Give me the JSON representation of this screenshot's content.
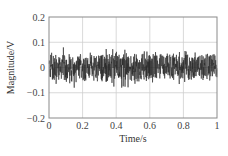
{
  "chart_data": {
    "type": "line",
    "title": "",
    "xlabel": "Time/s",
    "ylabel": "Magnitude/V",
    "xlim": [
      0,
      1
    ],
    "ylim": [
      -0.2,
      0.2
    ],
    "x_ticks": [
      0,
      0.2,
      0.4,
      0.6,
      0.8,
      1
    ],
    "x_tick_labels": [
      "0",
      "0.2",
      "0.4",
      "0.6",
      "0.8",
      "1"
    ],
    "y_ticks": [
      0.2,
      0.1,
      0,
      -0.1,
      -0.2
    ],
    "y_tick_labels": [
      "0.2",
      "0.1",
      "0",
      "−0.1",
      "−0.2"
    ],
    "grid": true,
    "legend": null,
    "series": [
      {
        "name": "noise signal",
        "description": "Dense broadband noise centered at 0 V, band roughly ±0.05 V with occasional spikes to about ±0.08 V",
        "color": "#2a2a2a",
        "mean": 0,
        "band_amplitude": 0.05,
        "peak_max": 0.085,
        "peak_min": -0.08,
        "num_points": 900
      }
    ]
  },
  "colors": {
    "axis": "#8a8a8a",
    "grid": "#cfcfcf",
    "signal": "#2a2a2a"
  }
}
